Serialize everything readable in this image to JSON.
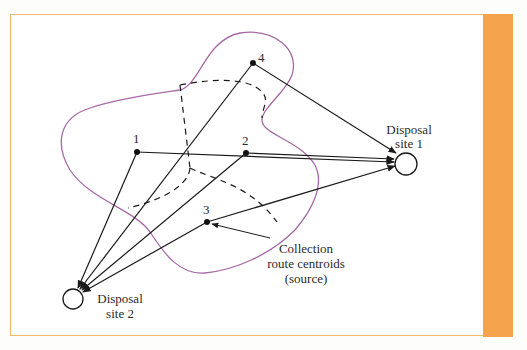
{
  "diagram": {
    "colors": {
      "frame_border": "#f3b869",
      "side_bar": "#f5a24c",
      "boundary": "#a66aa6",
      "lines": "#1a1a1a"
    },
    "sources": [
      {
        "id": "1",
        "label": "1"
      },
      {
        "id": "2",
        "label": "2"
      },
      {
        "id": "3",
        "label": "3"
      },
      {
        "id": "4",
        "label": "4"
      }
    ],
    "sinks": [
      {
        "id": "site1",
        "line1": "Disposal",
        "line2": "site 1"
      },
      {
        "id": "site2",
        "line1": "Disposal",
        "line2": "site 2"
      }
    ],
    "annotation": {
      "line1": "Collection",
      "line2": "route centroids",
      "line3": "(source)"
    },
    "edges": [
      {
        "from": "1",
        "to": "site1"
      },
      {
        "from": "2",
        "to": "site1"
      },
      {
        "from": "3",
        "to": "site1"
      },
      {
        "from": "4",
        "to": "site1"
      },
      {
        "from": "1",
        "to": "site2"
      },
      {
        "from": "2",
        "to": "site2"
      },
      {
        "from": "3",
        "to": "site2"
      },
      {
        "from": "4",
        "to": "site2"
      }
    ]
  }
}
